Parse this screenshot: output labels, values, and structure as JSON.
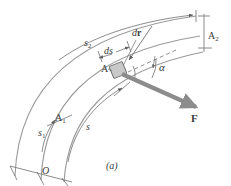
{
  "figure": {
    "caption": "(a)",
    "colors": {
      "curve": "#9a9a9a",
      "thin_line": "#6e6e6e",
      "force_arrow": "#8c8c8c",
      "block_fill": "#c9c9c9",
      "block_stroke": "#6e6e6e",
      "text": "#3a3a3a",
      "background": "#ffffff"
    },
    "labels": {
      "path_distance_s2": {
        "base": "s",
        "sub": "2"
      },
      "arc_element_ds": "ds",
      "displacement_dr_d": "d",
      "displacement_dr_r": "r",
      "point_A": "A",
      "position_A2": {
        "base": "A",
        "sub": "2"
      },
      "position_A1": {
        "base": "A",
        "sub": "1"
      },
      "path_distance_s1": {
        "base": "s",
        "sub": "1"
      },
      "path_distance_s": "s",
      "angle_alpha": "α",
      "force_F": "F",
      "origin_O": "O"
    }
  }
}
